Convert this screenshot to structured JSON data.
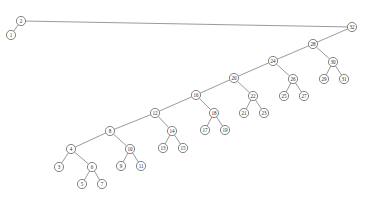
{
  "figure": {
    "background_color": "#ffffff",
    "node_fill": "#ffffff",
    "node_stroke": "#5c5c60",
    "edge_stroke": "#6f6f72",
    "label_color": "#2b2b2e",
    "node_radius": 4.6
  },
  "chart_data": {
    "type": "diagram",
    "diagram_kind": "binary-tree",
    "root": "2",
    "node_count": 32,
    "nodes": [
      {
        "id": "2",
        "label": "2",
        "x": 21,
        "y": 21,
        "depth": 0
      },
      {
        "id": "1",
        "label": "1",
        "x": 11,
        "y": 35,
        "depth": 1
      },
      {
        "id": "32",
        "label": "32",
        "x": 352,
        "y": 27,
        "depth": 1
      },
      {
        "id": "28",
        "label": "28",
        "x": 313,
        "y": 44,
        "depth": 2
      },
      {
        "id": "30",
        "label": "30",
        "x": 333,
        "y": 62,
        "depth": 3
      },
      {
        "id": "29",
        "label": "29",
        "x": 324,
        "y": 79,
        "depth": 4
      },
      {
        "id": "31",
        "label": "31",
        "x": 344,
        "y": 79,
        "depth": 4
      },
      {
        "id": "24",
        "label": "24",
        "x": 273,
        "y": 61,
        "depth": 3
      },
      {
        "id": "26",
        "label": "26",
        "x": 293,
        "y": 79,
        "depth": 4
      },
      {
        "id": "25",
        "label": "25",
        "x": 284,
        "y": 96,
        "depth": 5
      },
      {
        "id": "27",
        "label": "27",
        "x": 304,
        "y": 96,
        "depth": 5
      },
      {
        "id": "20",
        "label": "20",
        "x": 234,
        "y": 78,
        "depth": 4
      },
      {
        "id": "22",
        "label": "22",
        "x": 253,
        "y": 96,
        "depth": 5
      },
      {
        "id": "21",
        "label": "21",
        "x": 244,
        "y": 113,
        "depth": 6
      },
      {
        "id": "23",
        "label": "23",
        "x": 264,
        "y": 113,
        "depth": 6
      },
      {
        "id": "16",
        "label": "16",
        "x": 196,
        "y": 95,
        "depth": 5
      },
      {
        "id": "18",
        "label": "18",
        "x": 214,
        "y": 113,
        "depth": 6
      },
      {
        "id": "17",
        "label": "17",
        "x": 205,
        "y": 130,
        "depth": 7
      },
      {
        "id": "19",
        "label": "19",
        "x": 225,
        "y": 130,
        "depth": 7
      },
      {
        "id": "12",
        "label": "12",
        "x": 155,
        "y": 113,
        "depth": 6
      },
      {
        "id": "14",
        "label": "14",
        "x": 172,
        "y": 131,
        "depth": 7
      },
      {
        "id": "13",
        "label": "13",
        "x": 163,
        "y": 148,
        "depth": 8
      },
      {
        "id": "15",
        "label": "15",
        "x": 183,
        "y": 148,
        "depth": 8
      },
      {
        "id": "8",
        "label": "8",
        "x": 110,
        "y": 131,
        "depth": 7
      },
      {
        "id": "10",
        "label": "10",
        "x": 130,
        "y": 149,
        "depth": 8
      },
      {
        "id": "9",
        "label": "9",
        "x": 121,
        "y": 166,
        "depth": 9
      },
      {
        "id": "11",
        "label": "11",
        "x": 141,
        "y": 166,
        "depth": 9
      },
      {
        "id": "4",
        "label": "4",
        "x": 71,
        "y": 149,
        "depth": 8
      },
      {
        "id": "3",
        "label": "3",
        "x": 59,
        "y": 167,
        "depth": 9
      },
      {
        "id": "6",
        "label": "6",
        "x": 92,
        "y": 167,
        "depth": 9
      },
      {
        "id": "5",
        "label": "5",
        "x": 82,
        "y": 184,
        "depth": 10
      },
      {
        "id": "7",
        "label": "7",
        "x": 102,
        "y": 184,
        "depth": 10
      }
    ],
    "edges": [
      {
        "from": "2",
        "to": "1",
        "side": "left"
      },
      {
        "from": "2",
        "to": "32",
        "side": "right"
      },
      {
        "from": "32",
        "to": "28",
        "side": "left"
      },
      {
        "from": "28",
        "to": "30",
        "side": "right"
      },
      {
        "from": "30",
        "to": "29",
        "side": "left"
      },
      {
        "from": "30",
        "to": "31",
        "side": "right"
      },
      {
        "from": "28",
        "to": "24",
        "side": "left"
      },
      {
        "from": "24",
        "to": "26",
        "side": "right"
      },
      {
        "from": "26",
        "to": "25",
        "side": "left"
      },
      {
        "from": "26",
        "to": "27",
        "side": "right"
      },
      {
        "from": "24",
        "to": "20",
        "side": "left"
      },
      {
        "from": "20",
        "to": "22",
        "side": "right"
      },
      {
        "from": "22",
        "to": "21",
        "side": "left"
      },
      {
        "from": "22",
        "to": "23",
        "side": "right"
      },
      {
        "from": "20",
        "to": "16",
        "side": "left"
      },
      {
        "from": "16",
        "to": "18",
        "side": "right"
      },
      {
        "from": "18",
        "to": "17",
        "side": "left"
      },
      {
        "from": "18",
        "to": "19",
        "side": "right"
      },
      {
        "from": "16",
        "to": "12",
        "side": "left"
      },
      {
        "from": "12",
        "to": "14",
        "side": "right"
      },
      {
        "from": "14",
        "to": "13",
        "side": "left"
      },
      {
        "from": "14",
        "to": "15",
        "side": "right"
      },
      {
        "from": "12",
        "to": "8",
        "side": "left"
      },
      {
        "from": "8",
        "to": "10",
        "side": "right"
      },
      {
        "from": "10",
        "to": "9",
        "side": "left"
      },
      {
        "from": "10",
        "to": "11",
        "side": "right"
      },
      {
        "from": "8",
        "to": "4",
        "side": "left"
      },
      {
        "from": "4",
        "to": "3",
        "side": "left"
      },
      {
        "from": "4",
        "to": "6",
        "side": "right"
      },
      {
        "from": "6",
        "to": "5",
        "side": "left"
      },
      {
        "from": "6",
        "to": "7",
        "side": "right"
      }
    ]
  }
}
